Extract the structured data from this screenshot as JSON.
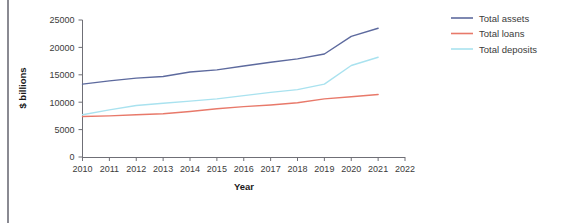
{
  "chart_data": {
    "type": "line",
    "title": "",
    "xlabel": "Year",
    "ylabel": "$ billions",
    "x": [
      2010,
      2011,
      2012,
      2013,
      2014,
      2015,
      2016,
      2017,
      2018,
      2019,
      2020,
      2021
    ],
    "xlim": [
      2010,
      2022
    ],
    "ylim": [
      0,
      25000
    ],
    "xticks": [
      "2010",
      "2011",
      "2012",
      "2013",
      "2014",
      "2015",
      "2016",
      "2017",
      "2018",
      "2019",
      "2020",
      "2021",
      "2022"
    ],
    "yticks": [
      "0",
      "5000",
      "10000",
      "15000",
      "20000",
      "25000"
    ],
    "ytick_values": [
      0,
      5000,
      10000,
      15000,
      20000,
      25000
    ],
    "grid": false,
    "legend_position": "right",
    "series": [
      {
        "name": "Total assets",
        "color": "#5d6a9e",
        "values": [
          13300,
          13900,
          14400,
          14700,
          15500,
          15900,
          16600,
          17300,
          17900,
          18800,
          22000,
          23500
        ]
      },
      {
        "name": "Total loans",
        "color": "#e8796a",
        "values": [
          7400,
          7500,
          7700,
          7900,
          8300,
          8800,
          9200,
          9500,
          9900,
          10600,
          11000,
          11400
        ]
      },
      {
        "name": "Total deposits",
        "color": "#a9e2ef",
        "values": [
          7700,
          8600,
          9400,
          9800,
          10200,
          10600,
          11200,
          11800,
          12300,
          13300,
          16700,
          18200
        ]
      }
    ]
  },
  "legend": {
    "entries": [
      {
        "label": "Total assets"
      },
      {
        "label": "Total loans"
      },
      {
        "label": "Total deposits"
      }
    ]
  },
  "axes": {
    "x_title": "Year",
    "y_title": "$ billions"
  }
}
